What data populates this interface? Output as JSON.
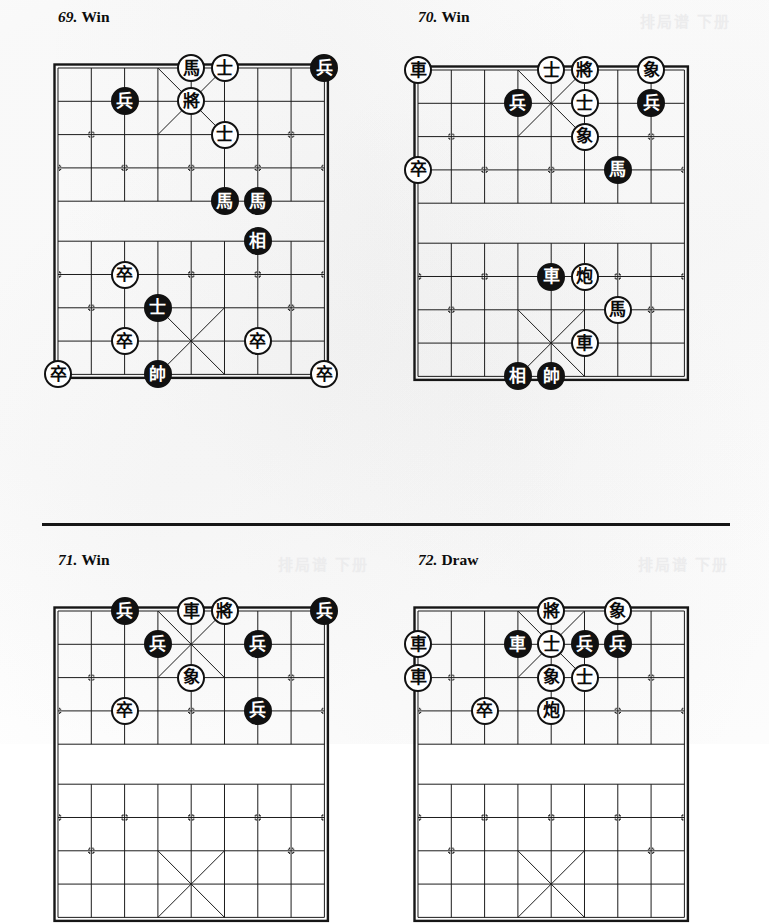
{
  "page": {
    "width": 769,
    "height": 744,
    "background": "#fefefe",
    "ink": "#111111",
    "divider_y": 523,
    "bleed_text": "排局谱 下册"
  },
  "board_geometry": {
    "cell": 33.3,
    "files": 9,
    "ranks": 10,
    "river_gap": 40,
    "note": "standard xiangqi 9x10 intersections, river between rank 4 and rank 5"
  },
  "problems": [
    {
      "id": "problem-69",
      "number": "69.",
      "result": "Win",
      "title_x": 58,
      "title_y": 8,
      "board_x": 58,
      "board_y": 68,
      "pieces": [
        {
          "name": "white-horse",
          "glyph": "馬",
          "color": "white",
          "file": 4,
          "rank": 0
        },
        {
          "name": "white-advisor",
          "glyph": "士",
          "color": "white",
          "file": 5,
          "rank": 0
        },
        {
          "name": "black-soldier",
          "glyph": "兵",
          "color": "black",
          "file": 8,
          "rank": 0
        },
        {
          "name": "black-soldier",
          "glyph": "兵",
          "color": "black",
          "file": 2,
          "rank": 1
        },
        {
          "name": "white-general",
          "glyph": "將",
          "color": "white",
          "file": 4,
          "rank": 1
        },
        {
          "name": "white-advisor",
          "glyph": "士",
          "color": "white",
          "file": 5,
          "rank": 2
        },
        {
          "name": "black-horse",
          "glyph": "馬",
          "color": "black",
          "file": 5,
          "rank": 4
        },
        {
          "name": "black-horse",
          "glyph": "馬",
          "color": "black",
          "file": 6,
          "rank": 4
        },
        {
          "name": "black-elephant",
          "glyph": "相",
          "color": "black",
          "file": 6,
          "rank": 5
        },
        {
          "name": "white-soldier",
          "glyph": "卒",
          "color": "white",
          "file": 2,
          "rank": 6
        },
        {
          "name": "black-advisor",
          "glyph": "士",
          "color": "black",
          "file": 3,
          "rank": 7
        },
        {
          "name": "white-soldier",
          "glyph": "卒",
          "color": "white",
          "file": 2,
          "rank": 8
        },
        {
          "name": "white-soldier",
          "glyph": "卒",
          "color": "white",
          "file": 6,
          "rank": 8
        },
        {
          "name": "white-soldier",
          "glyph": "卒",
          "color": "white",
          "file": 0,
          "rank": 9
        },
        {
          "name": "black-marshal",
          "glyph": "帥",
          "color": "black",
          "file": 3,
          "rank": 9
        },
        {
          "name": "white-soldier",
          "glyph": "卒",
          "color": "white",
          "file": 8,
          "rank": 9
        }
      ]
    },
    {
      "id": "problem-70",
      "number": "70.",
      "result": "Win",
      "title_x": 418,
      "title_y": 8,
      "board_x": 418,
      "board_y": 70,
      "pieces": [
        {
          "name": "white-chariot",
          "glyph": "車",
          "color": "white",
          "file": 0,
          "rank": 0
        },
        {
          "name": "white-advisor",
          "glyph": "士",
          "color": "white",
          "file": 4,
          "rank": 0
        },
        {
          "name": "white-general",
          "glyph": "將",
          "color": "white",
          "file": 5,
          "rank": 0
        },
        {
          "name": "white-elephant",
          "glyph": "象",
          "color": "white",
          "file": 7,
          "rank": 0
        },
        {
          "name": "black-soldier",
          "glyph": "兵",
          "color": "black",
          "file": 3,
          "rank": 1
        },
        {
          "name": "white-advisor",
          "glyph": "士",
          "color": "white",
          "file": 5,
          "rank": 1
        },
        {
          "name": "black-soldier",
          "glyph": "兵",
          "color": "black",
          "file": 7,
          "rank": 1
        },
        {
          "name": "white-elephant",
          "glyph": "象",
          "color": "white",
          "file": 5,
          "rank": 2
        },
        {
          "name": "white-soldier",
          "glyph": "卒",
          "color": "white",
          "file": 0,
          "rank": 3
        },
        {
          "name": "black-horse",
          "glyph": "馬",
          "color": "black",
          "file": 6,
          "rank": 3
        },
        {
          "name": "black-chariot",
          "glyph": "車",
          "color": "black",
          "file": 4,
          "rank": 6
        },
        {
          "name": "white-cannon",
          "glyph": "炮",
          "color": "white",
          "file": 5,
          "rank": 6
        },
        {
          "name": "white-horse",
          "glyph": "馬",
          "color": "white",
          "file": 6,
          "rank": 7
        },
        {
          "name": "white-chariot",
          "glyph": "車",
          "color": "white",
          "file": 5,
          "rank": 8
        },
        {
          "name": "black-elephant",
          "glyph": "相",
          "color": "black",
          "file": 3,
          "rank": 9
        },
        {
          "name": "black-marshal",
          "glyph": "帥",
          "color": "black",
          "file": 4,
          "rank": 9
        }
      ]
    },
    {
      "id": "problem-71",
      "number": "71.",
      "result": "Win",
      "title_x": 58,
      "title_y": 551,
      "board_x": 58,
      "board_y": 611,
      "pieces": [
        {
          "name": "black-soldier",
          "glyph": "兵",
          "color": "black",
          "file": 2,
          "rank": 0
        },
        {
          "name": "white-chariot",
          "glyph": "車",
          "color": "white",
          "file": 4,
          "rank": 0
        },
        {
          "name": "white-general",
          "glyph": "將",
          "color": "white",
          "file": 5,
          "rank": 0
        },
        {
          "name": "black-soldier",
          "glyph": "兵",
          "color": "black",
          "file": 8,
          "rank": 0
        },
        {
          "name": "black-soldier",
          "glyph": "兵",
          "color": "black",
          "file": 3,
          "rank": 1
        },
        {
          "name": "black-soldier",
          "glyph": "兵",
          "color": "black",
          "file": 6,
          "rank": 1
        },
        {
          "name": "white-elephant",
          "glyph": "象",
          "color": "white",
          "file": 4,
          "rank": 2
        },
        {
          "name": "white-soldier",
          "glyph": "卒",
          "color": "white",
          "file": 2,
          "rank": 3
        },
        {
          "name": "black-soldier",
          "glyph": "兵",
          "color": "black",
          "file": 6,
          "rank": 3
        }
      ]
    },
    {
      "id": "problem-72",
      "number": "72.",
      "result": "Draw",
      "title_x": 418,
      "title_y": 551,
      "board_x": 418,
      "board_y": 611,
      "pieces": [
        {
          "name": "white-general",
          "glyph": "將",
          "color": "white",
          "file": 4,
          "rank": 0
        },
        {
          "name": "white-elephant",
          "glyph": "象",
          "color": "white",
          "file": 6,
          "rank": 0
        },
        {
          "name": "white-chariot",
          "glyph": "車",
          "color": "white",
          "file": 0,
          "rank": 1
        },
        {
          "name": "black-chariot",
          "glyph": "車",
          "color": "black",
          "file": 3,
          "rank": 1
        },
        {
          "name": "white-advisor",
          "glyph": "士",
          "color": "white",
          "file": 4,
          "rank": 1
        },
        {
          "name": "black-soldier",
          "glyph": "兵",
          "color": "black",
          "file": 5,
          "rank": 1
        },
        {
          "name": "black-soldier",
          "glyph": "兵",
          "color": "black",
          "file": 6,
          "rank": 1
        },
        {
          "name": "white-chariot",
          "glyph": "車",
          "color": "white",
          "file": 0,
          "rank": 2
        },
        {
          "name": "white-elephant",
          "glyph": "象",
          "color": "white",
          "file": 4,
          "rank": 2
        },
        {
          "name": "white-advisor",
          "glyph": "士",
          "color": "white",
          "file": 5,
          "rank": 2
        },
        {
          "name": "white-soldier",
          "glyph": "卒",
          "color": "white",
          "file": 2,
          "rank": 3
        },
        {
          "name": "white-cannon",
          "glyph": "炮",
          "color": "white",
          "file": 4,
          "rank": 3
        }
      ]
    }
  ]
}
